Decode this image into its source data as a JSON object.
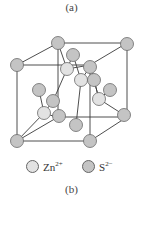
{
  "figure": {
    "caption_top": "(a)",
    "caption_bottom": "(b)"
  },
  "colors": {
    "zn": "#e2e2e2",
    "s": "#c4c4c4",
    "stroke": "#6a6a6a",
    "edge": "#3a3a3a"
  },
  "legend": [
    {
      "ion": "Zn",
      "charge": "2+",
      "color_key": "zn"
    },
    {
      "ion": "S",
      "charge": "2−",
      "color_key": "s"
    }
  ],
  "structure": {
    "cube_edges": [
      [
        17,
        65,
        90,
        65
      ],
      [
        90,
        65,
        90,
        141
      ],
      [
        90,
        141,
        17,
        141
      ],
      [
        17,
        141,
        17,
        65
      ],
      [
        58,
        43,
        127,
        43
      ],
      [
        127,
        43,
        127,
        117
      ],
      [
        127,
        117,
        58,
        117
      ],
      [
        58,
        117,
        58,
        43
      ],
      [
        17,
        65,
        58,
        43
      ],
      [
        90,
        65,
        127,
        43
      ],
      [
        90,
        141,
        127,
        117
      ],
      [
        17,
        141,
        58,
        117
      ]
    ],
    "bonds": [
      [
        67,
        69,
        58,
        43
      ],
      [
        67,
        69,
        73,
        55
      ],
      [
        67,
        69,
        90,
        65
      ],
      [
        67,
        69,
        53,
        101
      ],
      [
        81,
        80,
        73,
        55
      ],
      [
        81,
        80,
        90,
        67
      ],
      [
        81,
        80,
        94,
        80
      ],
      [
        81,
        80,
        76,
        125
      ],
      [
        99,
        99,
        90,
        65
      ],
      [
        99,
        99,
        110,
        90
      ],
      [
        99,
        99,
        124,
        115
      ],
      [
        99,
        99,
        94,
        80
      ],
      [
        44,
        113,
        39,
        90
      ],
      [
        44,
        113,
        53,
        101
      ],
      [
        44,
        113,
        17,
        141
      ],
      [
        44,
        113,
        59,
        118
      ]
    ],
    "spheres": [
      {
        "type": "s",
        "x": 58,
        "y": 43
      },
      {
        "type": "s",
        "x": 127,
        "y": 44
      },
      {
        "type": "s",
        "x": 73,
        "y": 55
      },
      {
        "type": "s",
        "x": 17,
        "y": 65
      },
      {
        "type": "zn",
        "x": 67,
        "y": 69
      },
      {
        "type": "s",
        "x": 90,
        "y": 67
      },
      {
        "type": "zn",
        "x": 81,
        "y": 80
      },
      {
        "type": "s",
        "x": 94,
        "y": 80
      },
      {
        "type": "s",
        "x": 39,
        "y": 90
      },
      {
        "type": "s",
        "x": 110,
        "y": 90
      },
      {
        "type": "s",
        "x": 53,
        "y": 101
      },
      {
        "type": "zn",
        "x": 99,
        "y": 99
      },
      {
        "type": "s",
        "x": 59,
        "y": 116
      },
      {
        "type": "zn",
        "x": 44,
        "y": 113
      },
      {
        "type": "s",
        "x": 124,
        "y": 115
      },
      {
        "type": "s",
        "x": 76,
        "y": 125
      },
      {
        "type": "s",
        "x": 17,
        "y": 141
      },
      {
        "type": "s",
        "x": 90,
        "y": 141
      }
    ],
    "sphere_radius": 6.5
  }
}
